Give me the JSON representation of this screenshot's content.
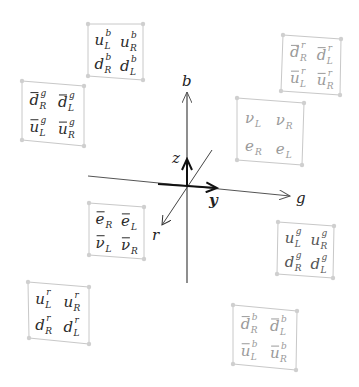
{
  "diagram": {
    "type": "fermion multiplets in color space",
    "axes": {
      "color_axes": [
        {
          "label": "b",
          "direction": "up"
        },
        {
          "label": "g",
          "direction": "right"
        },
        {
          "label": "r",
          "direction": "front-left-down"
        }
      ],
      "hypercharge_axes": [
        {
          "label": "z",
          "direction": "up"
        },
        {
          "label": "y",
          "direction": "right"
        }
      ]
    },
    "multiplets": [
      {
        "id": "quarks-blue",
        "shade": "dark",
        "cells": [
          {
            "base": "u",
            "sub": "L",
            "sup": "b",
            "bar": false
          },
          {
            "base": "u",
            "sub": "R",
            "sup": "b",
            "bar": false
          },
          {
            "base": "d",
            "sub": "R",
            "sup": "b",
            "bar": false
          },
          {
            "base": "d",
            "sub": "L",
            "sup": "b",
            "bar": false
          }
        ]
      },
      {
        "id": "antiquarks-green",
        "shade": "dark",
        "cells": [
          {
            "base": "d",
            "sub": "R",
            "sup": "g",
            "bar": true
          },
          {
            "base": "d",
            "sub": "L",
            "sup": "g",
            "bar": true
          },
          {
            "base": "u",
            "sub": "L",
            "sup": "g",
            "bar": true
          },
          {
            "base": "u",
            "sub": "R",
            "sup": "g",
            "bar": true
          }
        ]
      },
      {
        "id": "antiquarks-red",
        "shade": "light",
        "cells": [
          {
            "base": "d",
            "sub": "R",
            "sup": "r",
            "bar": true
          },
          {
            "base": "d",
            "sub": "L",
            "sup": "r",
            "bar": true
          },
          {
            "base": "u",
            "sub": "L",
            "sup": "r",
            "bar": true
          },
          {
            "base": "u",
            "sub": "R",
            "sup": "r",
            "bar": true
          }
        ]
      },
      {
        "id": "leptons",
        "shade": "light",
        "cells": [
          {
            "base": "ν",
            "sub": "L",
            "sup": "",
            "bar": false
          },
          {
            "base": "ν",
            "sub": "R",
            "sup": "",
            "bar": false
          },
          {
            "base": "e",
            "sub": "R",
            "sup": "",
            "bar": false
          },
          {
            "base": "e",
            "sub": "L",
            "sup": "",
            "bar": false
          }
        ]
      },
      {
        "id": "antileptons",
        "shade": "dark",
        "cells": [
          {
            "base": "e",
            "sub": "R",
            "sup": "",
            "bar": true
          },
          {
            "base": "e",
            "sub": "L",
            "sup": "",
            "bar": true
          },
          {
            "base": "ν",
            "sub": "L",
            "sup": "",
            "bar": true
          },
          {
            "base": "ν",
            "sub": "R",
            "sup": "",
            "bar": true
          }
        ]
      },
      {
        "id": "quarks-green",
        "shade": "mid",
        "cells": [
          {
            "base": "u",
            "sub": "L",
            "sup": "g",
            "bar": false
          },
          {
            "base": "u",
            "sub": "R",
            "sup": "g",
            "bar": false
          },
          {
            "base": "d",
            "sub": "R",
            "sup": "g",
            "bar": false
          },
          {
            "base": "d",
            "sub": "L",
            "sup": "g",
            "bar": false
          }
        ]
      },
      {
        "id": "quarks-red",
        "shade": "dark",
        "cells": [
          {
            "base": "u",
            "sub": "L",
            "sup": "r",
            "bar": false
          },
          {
            "base": "u",
            "sub": "R",
            "sup": "r",
            "bar": false
          },
          {
            "base": "d",
            "sub": "R",
            "sup": "r",
            "bar": false
          },
          {
            "base": "d",
            "sub": "L",
            "sup": "r",
            "bar": false
          }
        ]
      },
      {
        "id": "antiquarks-blue",
        "shade": "light",
        "cells": [
          {
            "base": "d",
            "sub": "R",
            "sup": "b",
            "bar": true
          },
          {
            "base": "d",
            "sub": "L",
            "sup": "b",
            "bar": true
          },
          {
            "base": "u",
            "sub": "L",
            "sup": "b",
            "bar": true
          },
          {
            "base": "u",
            "sub": "R",
            "sup": "b",
            "bar": true
          }
        ]
      }
    ],
    "colors": {
      "dark": "#2a2a2a",
      "mid": "#555555",
      "light": "#9a9a9a",
      "box": "#c8c8c8",
      "axis": "#333333"
    }
  }
}
